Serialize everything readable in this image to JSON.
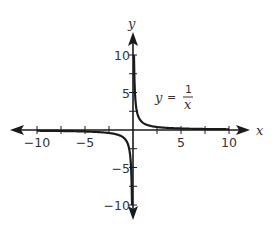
{
  "chart_data": {
    "type": "line",
    "title": "",
    "xlabel": "x",
    "ylabel": "y",
    "xlim": [
      -10,
      10
    ],
    "ylim": [
      -10,
      10
    ],
    "grid": false,
    "x_ticks": [
      -10,
      -7.5,
      -5,
      -2.5,
      2.5,
      5,
      7.5,
      10
    ],
    "y_ticks": [
      -10,
      -7.5,
      -5,
      -2.5,
      2.5,
      5,
      7.5,
      10
    ],
    "x_tick_labels": [
      {
        "value": -10,
        "label": "−10"
      },
      {
        "value": -5,
        "label": "−5"
      },
      {
        "value": 5,
        "label": "5"
      },
      {
        "value": 10,
        "label": "10"
      }
    ],
    "y_tick_labels": [
      {
        "value": 10,
        "label": "10"
      },
      {
        "value": 5,
        "label": "5"
      },
      {
        "value": -5,
        "label": "−5"
      },
      {
        "value": -10,
        "label": "−10"
      }
    ],
    "series": [
      {
        "name": "y = 1/x",
        "function": "1/x",
        "branches": [
          {
            "x": [
              0.1,
              0.15,
              0.2,
              0.3,
              0.5,
              0.75,
              1,
              1.5,
              2,
              3,
              5,
              7.5,
              10
            ],
            "y": [
              10,
              6.67,
              5,
              3.33,
              2,
              1.33,
              1,
              0.67,
              0.5,
              0.33,
              0.2,
              0.13,
              0.1
            ]
          },
          {
            "x": [
              -10,
              -7.5,
              -5,
              -3,
              -2,
              -1.5,
              -1,
              -0.75,
              -0.5,
              -0.3,
              -0.2,
              -0.15,
              -0.1
            ],
            "y": [
              -0.1,
              -0.13,
              -0.2,
              -0.33,
              -0.5,
              -0.67,
              -1,
              -1.33,
              -2,
              -3.33,
              -5,
              -6.67,
              -10
            ]
          }
        ]
      }
    ],
    "annotations": [
      {
        "text": "y = 1/x",
        "lhs": "y",
        "equals": "=",
        "numerator": "1",
        "denominator": "x",
        "position": {
          "x": 3,
          "y": 4.5
        }
      }
    ],
    "colors": {
      "curve": "#1a1a1a",
      "axes": "#1a1a1a",
      "text": "#333333"
    }
  }
}
